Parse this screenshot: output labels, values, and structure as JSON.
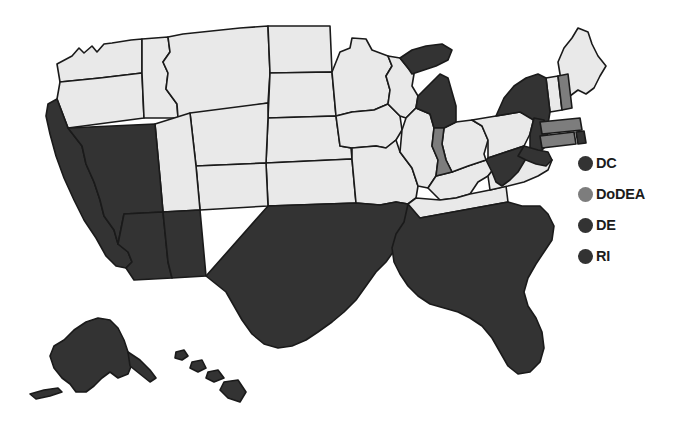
{
  "figure": {
    "type": "choropleth-map",
    "region": "United States",
    "background_color": "#ffffff"
  },
  "colors": {
    "dark": "#333333",
    "medium": "#7d7d7d",
    "light": "#e9e9e9",
    "outline": "#1a1a1a",
    "text": "#1c1c1c"
  },
  "legend": {
    "items": [
      {
        "label": "DC",
        "color_key": "dark",
        "color": "#333333"
      },
      {
        "label": "DoDEA",
        "color_key": "medium",
        "color": "#7d7d7d"
      },
      {
        "label": "DE",
        "color_key": "dark",
        "color": "#333333"
      },
      {
        "label": "RI",
        "color_key": "dark",
        "color": "#333333"
      }
    ]
  },
  "map_data": {
    "shading_categories": [
      "dark",
      "medium",
      "light"
    ],
    "states": [
      {
        "code": "AL",
        "shade": "dark"
      },
      {
        "code": "AK",
        "shade": "dark"
      },
      {
        "code": "AZ",
        "shade": "dark"
      },
      {
        "code": "AR",
        "shade": "dark"
      },
      {
        "code": "CA",
        "shade": "dark"
      },
      {
        "code": "CO",
        "shade": "light"
      },
      {
        "code": "CT",
        "shade": "medium"
      },
      {
        "code": "DE",
        "shade": "dark"
      },
      {
        "code": "DC",
        "shade": "dark"
      },
      {
        "code": "FL",
        "shade": "dark"
      },
      {
        "code": "GA",
        "shade": "dark"
      },
      {
        "code": "HI",
        "shade": "dark"
      },
      {
        "code": "ID",
        "shade": "light"
      },
      {
        "code": "IL",
        "shade": "light"
      },
      {
        "code": "IN",
        "shade": "medium"
      },
      {
        "code": "IA",
        "shade": "light"
      },
      {
        "code": "KS",
        "shade": "light"
      },
      {
        "code": "KY",
        "shade": "light"
      },
      {
        "code": "LA",
        "shade": "dark"
      },
      {
        "code": "ME",
        "shade": "light"
      },
      {
        "code": "MD",
        "shade": "dark"
      },
      {
        "code": "MA",
        "shade": "medium"
      },
      {
        "code": "MI",
        "shade": "dark"
      },
      {
        "code": "MN",
        "shade": "light"
      },
      {
        "code": "MS",
        "shade": "dark"
      },
      {
        "code": "MO",
        "shade": "light"
      },
      {
        "code": "MT",
        "shade": "light"
      },
      {
        "code": "NE",
        "shade": "light"
      },
      {
        "code": "NV",
        "shade": "dark"
      },
      {
        "code": "NH",
        "shade": "medium"
      },
      {
        "code": "NJ",
        "shade": "dark"
      },
      {
        "code": "NM",
        "shade": "dark"
      },
      {
        "code": "NY",
        "shade": "dark"
      },
      {
        "code": "NC",
        "shade": "dark"
      },
      {
        "code": "ND",
        "shade": "light"
      },
      {
        "code": "OH",
        "shade": "light"
      },
      {
        "code": "OK",
        "shade": "dark"
      },
      {
        "code": "OR",
        "shade": "light"
      },
      {
        "code": "PA",
        "shade": "light"
      },
      {
        "code": "RI",
        "shade": "dark"
      },
      {
        "code": "SC",
        "shade": "dark"
      },
      {
        "code": "SD",
        "shade": "light"
      },
      {
        "code": "TN",
        "shade": "light"
      },
      {
        "code": "TX",
        "shade": "dark"
      },
      {
        "code": "UT",
        "shade": "light"
      },
      {
        "code": "VT",
        "shade": "light"
      },
      {
        "code": "VA",
        "shade": "light"
      },
      {
        "code": "WA",
        "shade": "light"
      },
      {
        "code": "WV",
        "shade": "dark"
      },
      {
        "code": "WI",
        "shade": "light"
      },
      {
        "code": "WY",
        "shade": "light"
      }
    ]
  }
}
